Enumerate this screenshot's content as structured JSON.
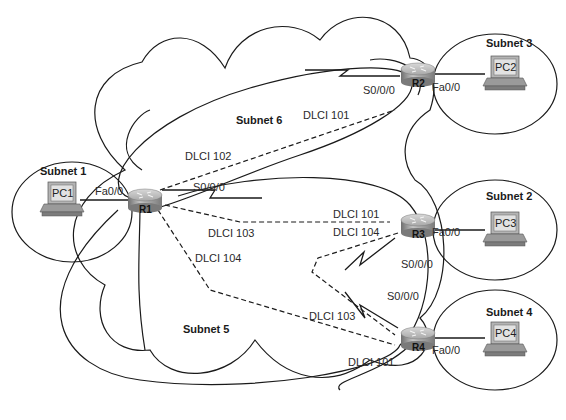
{
  "diagram": {
    "type": "frame-relay-network",
    "routers": [
      {
        "id": "R1",
        "label": "R1"
      },
      {
        "id": "R2",
        "label": "R2"
      },
      {
        "id": "R3",
        "label": "R3"
      },
      {
        "id": "R4",
        "label": "R4"
      }
    ],
    "pcs": [
      {
        "id": "PC1",
        "label": "PC1"
      },
      {
        "id": "PC2",
        "label": "PC2"
      },
      {
        "id": "PC3",
        "label": "PC3"
      },
      {
        "id": "PC4",
        "label": "PC4"
      }
    ],
    "subnets": {
      "s1": "Subnet 1",
      "s2": "Subnet 2",
      "s3": "Subnet 3",
      "s4": "Subnet 4",
      "s5": "Subnet 5",
      "s6": "Subnet 6"
    },
    "interfaces": {
      "r1_fa": "Fa0/0",
      "r1_serial": "S0/0/0",
      "r2_fa": "Fa0/0",
      "r2_serial": "S0/0/0",
      "r3_fa": "Fa0/0",
      "r3_serial": "S0/0/0",
      "r4_fa": "Fa0/0",
      "r4_serial": "S0/0/0"
    },
    "dlci": {
      "r1_to_r2": "DLCI 102",
      "r2_to_r1": "DLCI 101",
      "r1_to_r3": "DLCI 103",
      "r3_to_r1": "DLCI 101",
      "r1_to_r4": "DLCI 104",
      "r4_to_r1": "DLCI 101",
      "r3_to_r4": "DLCI 104",
      "r4_to_r3": "DLCI 103"
    },
    "colors": {
      "line": "#1a1a1a",
      "router_top": "#c8c8c8",
      "router_side": "#8a8a8a",
      "pc_screen": "#d8d8d8"
    }
  }
}
